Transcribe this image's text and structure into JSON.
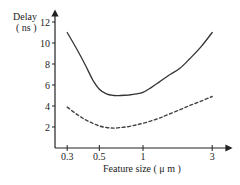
{
  "chart_data": {
    "type": "line",
    "title": "",
    "ylabel": "Delay",
    "ylabel_unit": "( ns )",
    "xlabel": "Feature size ( μ m )",
    "xscale": "log",
    "xlim": [
      0.26,
      3.8
    ],
    "ylim": [
      0,
      13
    ],
    "xticks": [
      0.3,
      0.5,
      1,
      3
    ],
    "xtick_labels": [
      "0.3",
      "0.5",
      "1",
      "3"
    ],
    "yticks": [
      2,
      4,
      6,
      8,
      10,
      12
    ],
    "ytick_labels": [
      "2",
      "4",
      "6",
      "8",
      "10",
      "12"
    ],
    "grid": false,
    "legend": null,
    "series": [
      {
        "name": "solid",
        "style": "solid",
        "color": "#333333",
        "x": [
          0.3,
          0.35,
          0.4,
          0.45,
          0.5,
          0.56,
          0.63,
          0.7,
          0.8,
          0.9,
          1.0,
          1.15,
          1.3,
          1.5,
          1.8,
          2.1,
          2.5,
          3.0
        ],
        "y": [
          11.0,
          9.4,
          7.9,
          6.5,
          5.6,
          5.15,
          5.0,
          5.0,
          5.05,
          5.15,
          5.3,
          5.8,
          6.3,
          6.9,
          7.6,
          8.5,
          9.6,
          11.0
        ]
      },
      {
        "name": "dashed",
        "style": "dashed",
        "color": "#444444",
        "x": [
          0.3,
          0.35,
          0.4,
          0.45,
          0.5,
          0.56,
          0.63,
          0.7,
          0.8,
          0.9,
          1.0,
          1.15,
          1.3,
          1.5,
          1.8,
          2.1,
          2.5,
          3.0
        ],
        "y": [
          3.9,
          3.2,
          2.7,
          2.35,
          2.1,
          1.95,
          1.9,
          1.95,
          2.05,
          2.2,
          2.35,
          2.6,
          2.85,
          3.2,
          3.65,
          4.05,
          4.45,
          4.9
        ]
      }
    ]
  }
}
